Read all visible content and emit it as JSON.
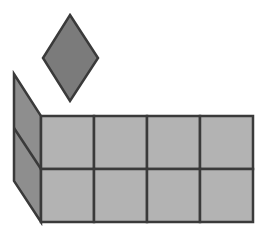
{
  "figure": {
    "grid": {
      "rows": 2,
      "cols": 4
    },
    "side_panel": {
      "sections": 2
    },
    "colors": {
      "background": "#ffffff",
      "grid_fill": "#b3b3b3",
      "side_fill": "#8e8e8e",
      "diamond_fill": "#7b7b7b",
      "stroke": "#3a3a3a"
    }
  }
}
